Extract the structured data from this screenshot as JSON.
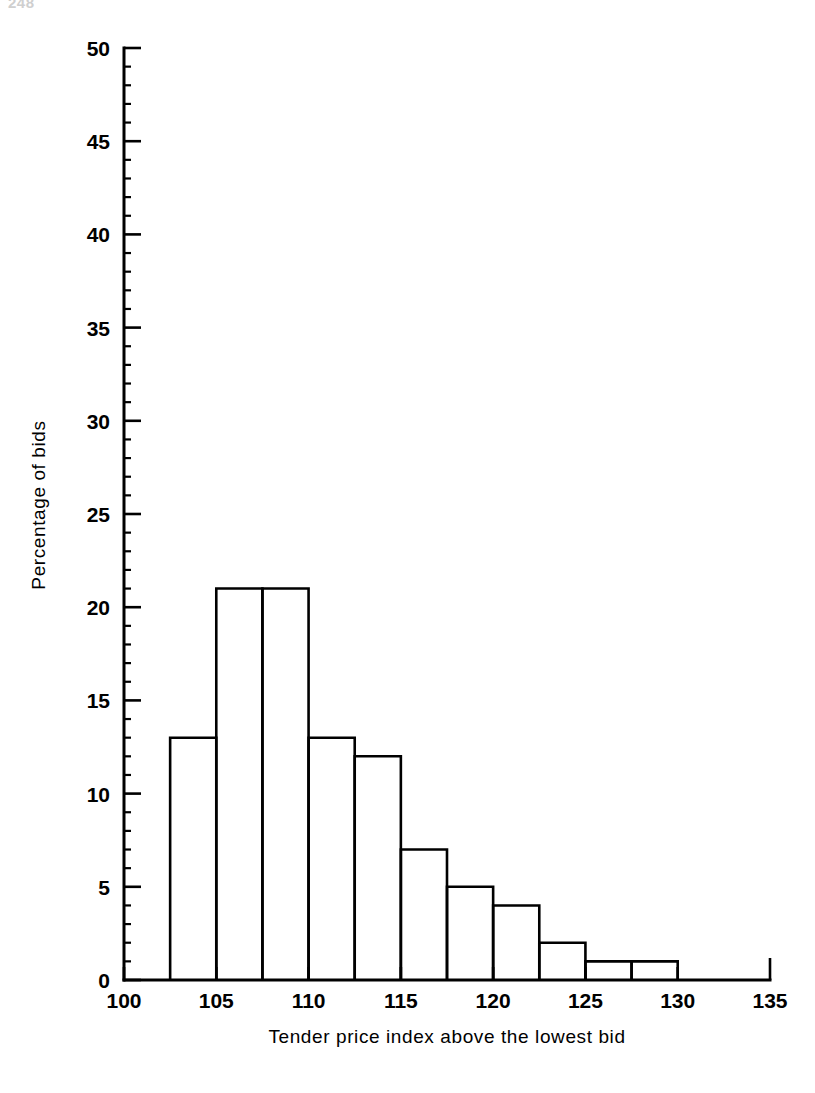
{
  "page": {
    "number": "248",
    "background": "#ffffff",
    "ink": "#000000"
  },
  "chart_data": {
    "type": "bar",
    "title": "",
    "subtitle": "",
    "xlabel": "Tender price index above the lowest bid",
    "ylabel": "Percentage of bids",
    "xlim": [
      100,
      135
    ],
    "ylim": [
      0,
      50
    ],
    "grid": false,
    "legend": null,
    "bin_width": 2.5,
    "x_tick_labels": [
      "100",
      "105",
      "110",
      "115",
      "120",
      "125",
      "130",
      "135"
    ],
    "x_ticks": [
      100,
      105,
      110,
      115,
      120,
      125,
      130,
      135
    ],
    "x_minor_ticks": [
      102.5,
      107.5,
      112.5,
      117.5,
      122.5,
      127.5,
      132.5
    ],
    "y_tick_labels": [
      "0",
      "5",
      "10",
      "15",
      "20",
      "25",
      "30",
      "35",
      "40",
      "45",
      "50"
    ],
    "y_ticks": [
      0,
      5,
      10,
      15,
      20,
      25,
      30,
      35,
      40,
      45,
      50
    ],
    "y_minor_ticks": [
      1,
      2,
      3,
      4,
      6,
      7,
      8,
      9,
      11,
      12,
      13,
      14,
      16,
      17,
      18,
      19,
      21,
      22,
      23,
      24,
      26,
      27,
      28,
      29,
      31,
      32,
      33,
      34,
      36,
      37,
      38,
      39,
      41,
      42,
      43,
      44,
      46,
      47,
      48,
      49
    ],
    "bins": [
      {
        "start": 102.5,
        "end": 105.0,
        "value": 13
      },
      {
        "start": 105.0,
        "end": 107.5,
        "value": 21
      },
      {
        "start": 107.5,
        "end": 110.0,
        "value": 21
      },
      {
        "start": 110.0,
        "end": 112.5,
        "value": 13
      },
      {
        "start": 112.5,
        "end": 115.0,
        "value": 12
      },
      {
        "start": 115.0,
        "end": 117.5,
        "value": 7
      },
      {
        "start": 117.5,
        "end": 120.0,
        "value": 5
      },
      {
        "start": 120.0,
        "end": 122.5,
        "value": 4
      },
      {
        "start": 122.5,
        "end": 125.0,
        "value": 2
      },
      {
        "start": 125.0,
        "end": 127.5,
        "value": 1
      },
      {
        "start": 127.5,
        "end": 130.0,
        "value": 1
      }
    ],
    "categories": [
      "102.5-105",
      "105-107.5",
      "107.5-110",
      "110-112.5",
      "112.5-115",
      "115-117.5",
      "117.5-120",
      "120-122.5",
      "122.5-125",
      "125-127.5",
      "127.5-130"
    ],
    "values": [
      13,
      21,
      21,
      13,
      12,
      7,
      5,
      4,
      2,
      1,
      1
    ]
  }
}
